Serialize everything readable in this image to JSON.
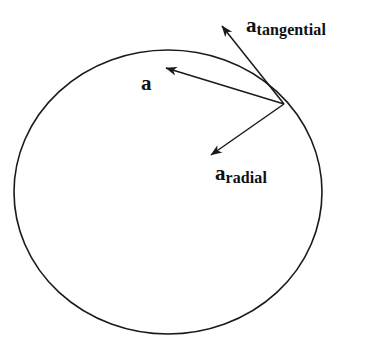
{
  "figure": {
    "background_color": "#ffffff",
    "stroke_color": "#1a1a1a",
    "text_color": "#111111"
  },
  "circle": {
    "name": "circular-path",
    "center_x": 168,
    "center_y": 192,
    "radius_x": 154,
    "radius_y": 142,
    "stroke_width": 1.6
  },
  "origin_point": {
    "x": 284,
    "y": 104,
    "description": "point on circle where all acceleration vectors originate"
  },
  "vectors": [
    {
      "id": "a-total",
      "label_base": "a",
      "label_sub": "",
      "from_x": 284,
      "from_y": 104,
      "to_x": 166,
      "to_y": 68
    },
    {
      "id": "a-tangential",
      "label_base": "a",
      "label_sub": "tangential",
      "from_x": 284,
      "from_y": 104,
      "to_x": 222,
      "to_y": 26
    },
    {
      "id": "a-radial",
      "label_base": "a",
      "label_sub": "radial",
      "from_x": 284,
      "from_y": 104,
      "to_x": 211,
      "to_y": 155
    }
  ],
  "labels": {
    "a": {
      "base": "a",
      "sub": ""
    },
    "a_tangential": {
      "base": "a",
      "sub": "tangential"
    },
    "a_radial": {
      "base": "a",
      "sub": "radial"
    }
  }
}
